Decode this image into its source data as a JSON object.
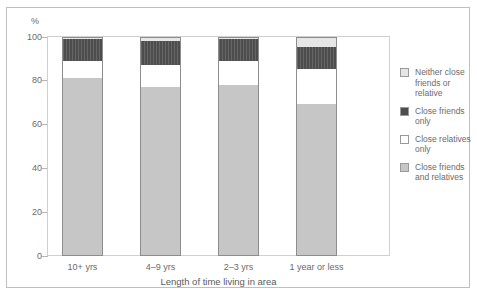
{
  "chart_data": {
    "type": "bar",
    "stacked": true,
    "title": "",
    "xlabel": "Length of time living in area",
    "ylabel": "%",
    "ylim": [
      0,
      100
    ],
    "yticks": [
      100,
      80,
      60,
      40,
      20,
      0
    ],
    "grid": true,
    "legend_position": "right",
    "categories": [
      "10+ yrs",
      "4–9 yrs",
      "2–3 yrs",
      "1 year or less"
    ],
    "series": [
      {
        "name": "Close friends and relatives",
        "key": "both",
        "color": "#c6c6c6",
        "values": [
          81,
          77,
          78,
          69
        ]
      },
      {
        "name": "Close relatives only",
        "key": "relatives",
        "color": "#ffffff",
        "values": [
          8,
          10,
          11,
          16
        ]
      },
      {
        "name": "Close friends only",
        "key": "friends",
        "color": "#4d4d4d",
        "values": [
          10,
          11,
          10,
          10
        ]
      },
      {
        "name": "Neither close friends or relative",
        "key": "neither",
        "color": "#e6e6e6",
        "values": [
          1,
          2,
          1,
          5
        ]
      }
    ]
  },
  "axis": {
    "y_unit": "%",
    "ticks": [
      {
        "label": "100",
        "value": 100
      },
      {
        "label": "80",
        "value": 80
      },
      {
        "label": "60",
        "value": 60
      },
      {
        "label": "40",
        "value": 40
      },
      {
        "label": "20",
        "value": 20
      },
      {
        "label": "0",
        "value": 0
      }
    ],
    "x_title": "Length of time living in area",
    "x_categories": [
      "10+ yrs",
      "4–9 yrs",
      "2–3 yrs",
      "1 year or less"
    ]
  },
  "legend": {
    "items": [
      {
        "label": "Neither close friends or relative",
        "swatch": "sw-neither"
      },
      {
        "label": "Close friends only",
        "swatch": "sw-friends"
      },
      {
        "label": "Close relatives only",
        "swatch": "sw-relatives"
      },
      {
        "label": "Close friends and relatives",
        "swatch": "sw-both"
      }
    ]
  }
}
